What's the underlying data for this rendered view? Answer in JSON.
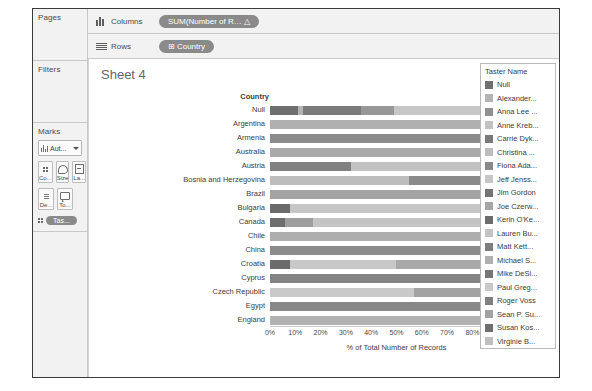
{
  "window": {
    "title": "Tableau Worksheet"
  },
  "left_panels": {
    "pages": {
      "title": "Pages"
    },
    "filters": {
      "title": "Filters"
    },
    "marks": {
      "title": "Marks",
      "type_dropdown": "Aut...",
      "buttons": [
        {
          "icon": "color-icon",
          "label": "Co..."
        },
        {
          "icon": "size-icon",
          "label": "Size"
        },
        {
          "icon": "label-icon",
          "label": "La..."
        },
        {
          "icon": "detail-icon",
          "label": "De..."
        },
        {
          "icon": "tooltip-icon",
          "label": "To..."
        }
      ],
      "pill": "Tas..."
    }
  },
  "shelves": {
    "columns": {
      "label": "Columns",
      "pill": "SUM(Number of R…  △"
    },
    "rows": {
      "label": "Rows",
      "pill": "⊞  Country"
    }
  },
  "sheet": {
    "title": "Sheet 4"
  },
  "scrollbar": {
    "up": "▲",
    "down": "▼"
  },
  "legend": {
    "title": "Taster Name",
    "items": [
      {
        "label": "Null",
        "color": "#6f6f6f"
      },
      {
        "label": "Alexander...",
        "color": "#b4b4b4"
      },
      {
        "label": "Anna Lee ...",
        "color": "#8f8f8f"
      },
      {
        "label": "Anne Kreb...",
        "color": "#c2c2c2"
      },
      {
        "label": "Carrie Dyk...",
        "color": "#7a7a7a"
      },
      {
        "label": "Christina ...",
        "color": "#bdbdbd"
      },
      {
        "label": "Fiona Ada...",
        "color": "#898989"
      },
      {
        "label": "Jeff Jenss...",
        "color": "#c6c6c6"
      },
      {
        "label": "Jim Gordon",
        "color": "#747474"
      },
      {
        "label": "Joe Czerw...",
        "color": "#a6a6a6"
      },
      {
        "label": "Kerin O'Ke...",
        "color": "#6c6c6c"
      },
      {
        "label": "Lauren Bu...",
        "color": "#c4c4c4"
      },
      {
        "label": "Matt Kett...",
        "color": "#7e7e7e"
      },
      {
        "label": "Michael S...",
        "color": "#b0b0b0"
      },
      {
        "label": "Mike DeSi...",
        "color": "#767676"
      },
      {
        "label": "Paul Greg...",
        "color": "#c9c9c9"
      },
      {
        "label": "Roger Voss",
        "color": "#808080"
      },
      {
        "label": "Sean P. Su...",
        "color": "#a2a2a2"
      },
      {
        "label": "Susan Kos...",
        "color": "#6e6e6e"
      },
      {
        "label": "Virginie B...",
        "color": "#bfbfbf"
      }
    ]
  },
  "chart_data": {
    "type": "bar",
    "title": "Sheet 4",
    "orientation": "horizontal",
    "stacked": true,
    "normalized": true,
    "ylabel": "Country",
    "xlabel": "% of Total Number of Records",
    "xlim": [
      0,
      100
    ],
    "xticks": [
      0,
      10,
      20,
      30,
      40,
      50,
      60,
      70,
      80,
      90,
      100
    ],
    "xtick_labels": [
      "0%",
      "10%",
      "20%",
      "30%",
      "40%",
      "50%",
      "60%",
      "70%",
      "80%",
      "90%",
      "100%"
    ],
    "grid": false,
    "legend_position": "right",
    "legend_title": "Taster Name",
    "categories": [
      "Null",
      "Argentina",
      "Armenia",
      "Australia",
      "Austria",
      "Bosnia and Herzegovina",
      "Brazil",
      "Bulgaria",
      "Canada",
      "Chile",
      "China",
      "Croatia",
      "Cyprus",
      "Czech Republic",
      "Egypt",
      "England"
    ],
    "rows": [
      {
        "category": "Null",
        "segments": [
          {
            "name": "Null",
            "color": "#6f6f6f",
            "value": 11
          },
          {
            "name": "Alexander...",
            "color": "#b4b4b4",
            "value": 2
          },
          {
            "name": "Carrie Dyk...",
            "color": "#7a7a7a",
            "value": 23
          },
          {
            "name": "Anna Lee ...",
            "color": "#979797",
            "value": 13
          },
          {
            "name": "Paul Greg...",
            "color": "#c6c6c6",
            "value": 51
          }
        ]
      },
      {
        "category": "Argentina",
        "segments": [
          {
            "name": "Michael S...",
            "color": "#b0b0b0",
            "value": 100
          }
        ]
      },
      {
        "category": "Armenia",
        "segments": [
          {
            "name": "Mike DeSi...",
            "color": "#8b8b8b",
            "value": 100
          }
        ]
      },
      {
        "category": "Australia",
        "segments": [
          {
            "name": "Joe Czerw...",
            "color": "#a9a9a9",
            "value": 86
          },
          {
            "name": "Jim Gordon",
            "color": "#6f6f6f",
            "value": 14
          }
        ]
      },
      {
        "category": "Austria",
        "segments": [
          {
            "name": "Roger Voss",
            "color": "#808080",
            "value": 32
          },
          {
            "name": "Anne Kreb...",
            "color": "#c2c2c2",
            "value": 68
          }
        ]
      },
      {
        "category": "Bosnia and Herzegovina",
        "segments": [
          {
            "name": "Jeff Jenss...",
            "color": "#bdbdbd",
            "value": 55
          },
          {
            "name": "Matt Kett...",
            "color": "#8a8a8a",
            "value": 45
          }
        ]
      },
      {
        "category": "Brazil",
        "segments": [
          {
            "name": "Michael S...",
            "color": "#a4a4a4",
            "value": 100
          }
        ]
      },
      {
        "category": "Bulgaria",
        "segments": [
          {
            "name": "Null",
            "color": "#6a6a6a",
            "value": 8
          },
          {
            "name": "Christina ...",
            "color": "#c6c6c6",
            "value": 76
          },
          {
            "name": "Susan Kos...",
            "color": "#9c9c9c",
            "value": 16
          }
        ]
      },
      {
        "category": "Canada",
        "segments": [
          {
            "name": "Null",
            "color": "#6e6e6e",
            "value": 6
          },
          {
            "name": "Sean P. Su...",
            "color": "#9e9e9e",
            "value": 11
          },
          {
            "name": "Fiona Ada...",
            "color": "#c4c4c4",
            "value": 72
          },
          {
            "name": "Lauren Bu...",
            "color": "#a0a0a0",
            "value": 11
          }
        ]
      },
      {
        "category": "Chile",
        "segments": [
          {
            "name": "Michael S...",
            "color": "#aeaeae",
            "value": 96
          },
          {
            "name": "Kerin O'Ke...",
            "color": "#6c6c6c",
            "value": 4
          }
        ]
      },
      {
        "category": "China",
        "segments": [
          {
            "name": "Jim Gordon",
            "color": "#8c8c8c",
            "value": 100
          }
        ]
      },
      {
        "category": "Croatia",
        "segments": [
          {
            "name": "Null",
            "color": "#6b6b6b",
            "value": 8
          },
          {
            "name": "Paul Greg...",
            "color": "#c8c8c8",
            "value": 42
          },
          {
            "name": "Michael S...",
            "color": "#a8a8a8",
            "value": 50
          }
        ]
      },
      {
        "category": "Cyprus",
        "segments": [
          {
            "name": "Mike DeSi...",
            "color": "#848484",
            "value": 100
          }
        ]
      },
      {
        "category": "Czech Republic",
        "segments": [
          {
            "name": "Paul Greg...",
            "color": "#c9c9c9",
            "value": 57
          },
          {
            "name": "Anna Lee ...",
            "color": "#a3a3a3",
            "value": 43
          }
        ]
      },
      {
        "category": "Egypt",
        "segments": [
          {
            "name": "Matt Kett...",
            "color": "#888888",
            "value": 100
          }
        ]
      },
      {
        "category": "England",
        "segments": [
          {
            "name": "Roger Voss",
            "color": "#b2b2b2",
            "value": 100
          }
        ]
      }
    ]
  }
}
